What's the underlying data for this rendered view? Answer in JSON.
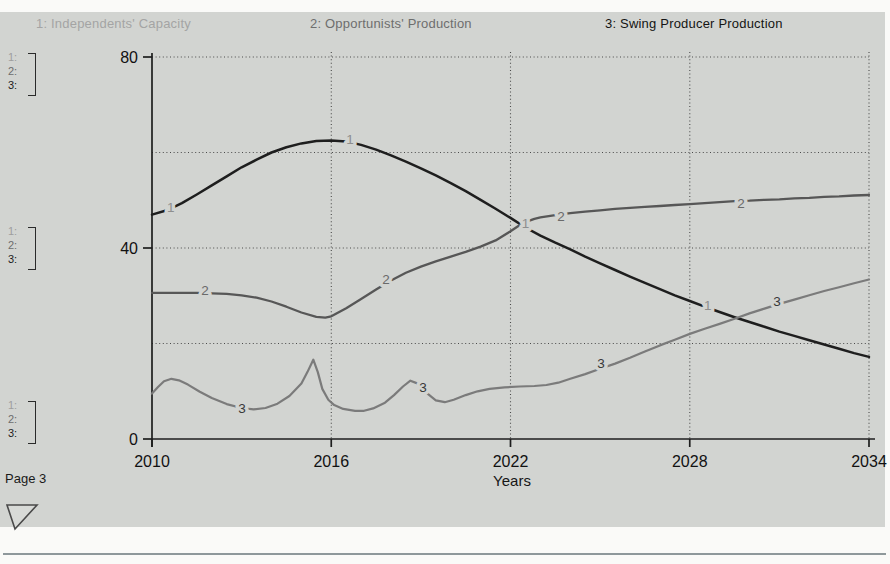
{
  "legend": {
    "items": [
      {
        "label": "1: Independents' Capacity",
        "color": "#a4a4a4"
      },
      {
        "label": "2: Opportunists' Production",
        "color": "#6e6e6e"
      },
      {
        "label": "3: Swing Producer Production",
        "color": "#141414"
      }
    ]
  },
  "scale_groups": {
    "rows": [
      "1:",
      "2:",
      "3:"
    ],
    "row_colors": [
      "#9e9e9e",
      "#6d6d6d",
      "#1c1c1c"
    ]
  },
  "footer": {
    "page_label": "Page 3"
  },
  "chart_data": {
    "type": "line",
    "title": "",
    "xlabel": "Years",
    "ylabel": "",
    "xlim": [
      2010,
      2034
    ],
    "ylim": [
      0,
      80
    ],
    "grid": "dotted",
    "legend_position": "top",
    "x_gridlines": [
      2016,
      2022,
      2028,
      2034
    ],
    "y_gridlines": [
      20,
      40,
      60,
      80
    ],
    "x_ticks": [
      {
        "value": 2010,
        "label": "2010"
      },
      {
        "value": 2016,
        "label": "2016"
      },
      {
        "value": 2022,
        "label": "2022"
      },
      {
        "value": 2028,
        "label": "2028"
      },
      {
        "value": 2034,
        "label": "2034"
      }
    ],
    "y_ticks": [
      {
        "value": 0,
        "label": "0"
      },
      {
        "value": 40,
        "label": "40"
      },
      {
        "value": 80,
        "label": "80"
      }
    ],
    "series": [
      {
        "id": "1",
        "name": "Independents' Capacity",
        "color": "#1e1e1e",
        "label_color": "#8e8e8e",
        "stroke_width": 2.5,
        "points": [
          [
            2010,
            47
          ],
          [
            2010.5,
            47.9
          ],
          [
            2011,
            49.4
          ],
          [
            2011.5,
            51.2
          ],
          [
            2012,
            53.1
          ],
          [
            2012.5,
            55
          ],
          [
            2013,
            56.9
          ],
          [
            2013.5,
            58.5
          ],
          [
            2014,
            60
          ],
          [
            2014.5,
            61.1
          ],
          [
            2015,
            61.9
          ],
          [
            2015.5,
            62.4
          ],
          [
            2016,
            62.5
          ],
          [
            2016.5,
            62.3
          ],
          [
            2017,
            61.6
          ],
          [
            2017.5,
            60.6
          ],
          [
            2018,
            59.4
          ],
          [
            2018.5,
            58.1
          ],
          [
            2019,
            56.7
          ],
          [
            2019.5,
            55.2
          ],
          [
            2020,
            53.6
          ],
          [
            2020.5,
            51.9
          ],
          [
            2021,
            50.1
          ],
          [
            2021.5,
            48.2
          ],
          [
            2022,
            46.3
          ],
          [
            2022.5,
            44.3
          ],
          [
            2023,
            42.6
          ],
          [
            2023.5,
            41.1
          ],
          [
            2024,
            39.7
          ],
          [
            2024.5,
            38.2
          ],
          [
            2025,
            36.8
          ],
          [
            2025.5,
            35.4
          ],
          [
            2026,
            34
          ],
          [
            2026.5,
            32.7
          ],
          [
            2027,
            31.4
          ],
          [
            2027.5,
            30.1
          ],
          [
            2028,
            28.9
          ],
          [
            2028.5,
            27.7
          ],
          [
            2029,
            26.6
          ],
          [
            2029.5,
            25.5
          ],
          [
            2030,
            24.5
          ],
          [
            2030.5,
            23.5
          ],
          [
            2031,
            22.5
          ],
          [
            2031.5,
            21.6
          ],
          [
            2032,
            20.7
          ],
          [
            2032.5,
            19.8
          ],
          [
            2033,
            18.9
          ],
          [
            2033.5,
            18
          ],
          [
            2034,
            17.2
          ]
        ],
        "label_points": [
          [
            2010.63,
            48.6
          ],
          [
            2016.63,
            62.8
          ],
          [
            2022.5,
            45.2
          ],
          [
            2028.6,
            28.1
          ]
        ]
      },
      {
        "id": "2",
        "name": "Opportunists' Production",
        "color": "#575757",
        "label_color": "#6a6a6a",
        "stroke_width": 2.3,
        "points": [
          [
            2010,
            30.6
          ],
          [
            2010.5,
            30.6
          ],
          [
            2011,
            30.6
          ],
          [
            2011.5,
            30.6
          ],
          [
            2012,
            30.5
          ],
          [
            2012.5,
            30.4
          ],
          [
            2013,
            30.1
          ],
          [
            2013.5,
            29.6
          ],
          [
            2014,
            28.8
          ],
          [
            2014.5,
            27.7
          ],
          [
            2015,
            26.5
          ],
          [
            2015.5,
            25.6
          ],
          [
            2015.8,
            25.4
          ],
          [
            2016,
            25.7
          ],
          [
            2016.5,
            27.4
          ],
          [
            2017,
            29.3
          ],
          [
            2017.5,
            31.3
          ],
          [
            2018,
            33.2
          ],
          [
            2018.5,
            34.8
          ],
          [
            2019,
            36.1
          ],
          [
            2019.5,
            37.2
          ],
          [
            2020,
            38.2
          ],
          [
            2020.5,
            39.2
          ],
          [
            2021,
            40.3
          ],
          [
            2021.5,
            41.6
          ],
          [
            2022,
            43.5
          ],
          [
            2022.4,
            45.2
          ],
          [
            2022.8,
            46.1
          ],
          [
            2023,
            46.4
          ],
          [
            2023.5,
            46.9
          ],
          [
            2024,
            47.3
          ],
          [
            2024.5,
            47.6
          ],
          [
            2025,
            47.9
          ],
          [
            2025.5,
            48.2
          ],
          [
            2026,
            48.4
          ],
          [
            2026.5,
            48.6
          ],
          [
            2027,
            48.8
          ],
          [
            2027.5,
            49
          ],
          [
            2028,
            49.2
          ],
          [
            2028.5,
            49.4
          ],
          [
            2029,
            49.6
          ],
          [
            2029.5,
            49.8
          ],
          [
            2030,
            49.9
          ],
          [
            2030.5,
            50.1
          ],
          [
            2031,
            50.2
          ],
          [
            2031.5,
            50.4
          ],
          [
            2032,
            50.5
          ],
          [
            2032.5,
            50.7
          ],
          [
            2033,
            50.8
          ],
          [
            2033.5,
            51
          ],
          [
            2034,
            51.1
          ]
        ],
        "label_points": [
          [
            2011.77,
            31.2
          ],
          [
            2017.83,
            33.5
          ],
          [
            2023.69,
            46.7
          ],
          [
            2029.72,
            49.4
          ]
        ]
      },
      {
        "id": "3",
        "name": "Swing Producer Production",
        "color": "#7b7b7b",
        "label_color": "#383838",
        "stroke_width": 2.2,
        "points": [
          [
            2010,
            9.5
          ],
          [
            2010.2,
            10.9
          ],
          [
            2010.4,
            12.1
          ],
          [
            2010.65,
            12.6
          ],
          [
            2010.9,
            12.3
          ],
          [
            2011.2,
            11.4
          ],
          [
            2011.6,
            9.9
          ],
          [
            2012,
            8.6
          ],
          [
            2012.5,
            7.3
          ],
          [
            2013,
            6.5
          ],
          [
            2013.4,
            6.2
          ],
          [
            2013.8,
            6.5
          ],
          [
            2014.2,
            7.4
          ],
          [
            2014.6,
            9
          ],
          [
            2015,
            11.6
          ],
          [
            2015.2,
            14
          ],
          [
            2015.4,
            16.6
          ],
          [
            2015.55,
            14
          ],
          [
            2015.7,
            10.5
          ],
          [
            2015.9,
            8.2
          ],
          [
            2016.1,
            7.1
          ],
          [
            2016.4,
            6.3
          ],
          [
            2016.8,
            5.9
          ],
          [
            2017.1,
            5.9
          ],
          [
            2017.4,
            6.4
          ],
          [
            2017.8,
            7.6
          ],
          [
            2018.1,
            9.2
          ],
          [
            2018.4,
            11
          ],
          [
            2018.65,
            12.2
          ],
          [
            2018.9,
            11.6
          ],
          [
            2019.2,
            9.6
          ],
          [
            2019.5,
            8.1
          ],
          [
            2019.8,
            7.7
          ],
          [
            2020.1,
            8.2
          ],
          [
            2020.5,
            9.2
          ],
          [
            2020.9,
            10
          ],
          [
            2021.3,
            10.5
          ],
          [
            2021.8,
            10.8
          ],
          [
            2022.3,
            11
          ],
          [
            2022.8,
            11.1
          ],
          [
            2023.2,
            11.3
          ],
          [
            2023.6,
            11.8
          ],
          [
            2024,
            12.6
          ],
          [
            2024.5,
            13.6
          ],
          [
            2025,
            14.7
          ],
          [
            2025.5,
            15.8
          ],
          [
            2026,
            17
          ],
          [
            2026.5,
            18.3
          ],
          [
            2027,
            19.6
          ],
          [
            2027.5,
            20.8
          ],
          [
            2028,
            22
          ],
          [
            2028.5,
            23.1
          ],
          [
            2029,
            24.1
          ],
          [
            2029.5,
            25.2
          ],
          [
            2030,
            26.3
          ],
          [
            2030.5,
            27.3
          ],
          [
            2031,
            28.3
          ],
          [
            2031.5,
            29.2
          ],
          [
            2032,
            30.1
          ],
          [
            2032.5,
            31
          ],
          [
            2033,
            31.8
          ],
          [
            2033.5,
            32.6
          ],
          [
            2034,
            33.4
          ]
        ],
        "label_points": [
          [
            2013.01,
            6.5
          ],
          [
            2019.07,
            10.9
          ],
          [
            2025.03,
            15.9
          ],
          [
            2030.92,
            28.9
          ]
        ]
      }
    ]
  }
}
